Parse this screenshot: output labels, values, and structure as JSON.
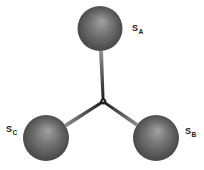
{
  "figure": {
    "background": "#ffffff",
    "atoms": [
      {
        "label_base": "S",
        "label_sub": "A",
        "position": "top"
      },
      {
        "label_base": "S",
        "label_sub": "B",
        "position": "bottom-right"
      },
      {
        "label_base": "S",
        "label_sub": "C",
        "position": "bottom-left"
      }
    ],
    "colors": {
      "sphere_highlight": "#a2a2a2",
      "sphere_mid": "#737373",
      "sphere_rim": "#424242",
      "bond_light": "#8f8f8f",
      "bond_dark": "#1c1c1c",
      "center_dot": "#ababab",
      "label": "#1a1a1a"
    }
  }
}
